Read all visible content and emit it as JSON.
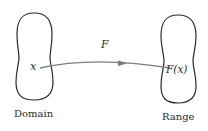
{
  "diagram": {
    "domain": {
      "label": "Domain",
      "point_label": "x"
    },
    "range": {
      "label": "Range",
      "point_label": "F(x)"
    },
    "mapping": {
      "label": "F"
    },
    "colors": {
      "outline": "#2a2a2a",
      "arrow": "#7a7f86",
      "text": "#2a2a2a"
    }
  }
}
